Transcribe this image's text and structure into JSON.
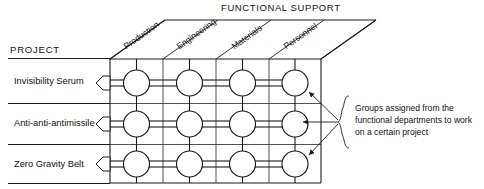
{
  "diagram": {
    "title_header": "FUNCTIONAL SUPPORT",
    "axis_label": "PROJECT",
    "columns": [
      {
        "label": "Production"
      },
      {
        "label": "Engineering"
      },
      {
        "label": "Materials"
      },
      {
        "label": "Personnel"
      }
    ],
    "rows": [
      {
        "label": "Invisibility Serum"
      },
      {
        "label": "Anti-anti-antimissile"
      },
      {
        "label": "Zero Gravity Belt"
      }
    ],
    "annotation": {
      "line1": "Groups assigned from the",
      "line2": "functional departments to work",
      "line3": "on a certain project"
    },
    "colors": {
      "ink": "#1a1a1a",
      "grid": "#333333",
      "background": "#ffffff"
    }
  }
}
